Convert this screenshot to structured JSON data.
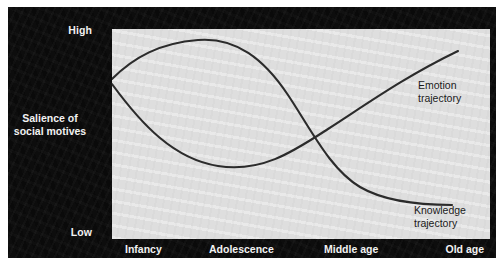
{
  "figure": {
    "panel_color": "#0d0d0d",
    "plot_color": "#dedede",
    "curve_color": "#2b2b2b",
    "text_light": "#f2f2f2",
    "text_dark": "#1a1a1a"
  },
  "axes": {
    "y_label_line1": "Salience of",
    "y_label_line2": "social motives",
    "y_high": "High",
    "y_low": "Low",
    "x_ticks": [
      {
        "label": "Infancy",
        "pos_pct": 8
      },
      {
        "label": "Adolescence",
        "pos_pct": 33
      },
      {
        "label": "Middle age",
        "pos_pct": 61
      },
      {
        "label": "Old age",
        "pos_pct": 90
      }
    ]
  },
  "annotations": {
    "emotion_line1": "Emotion",
    "emotion_line2": "trajectory",
    "knowledge_line1": "Knowledge",
    "knowledge_line2": "trajectory"
  },
  "chart_data": {
    "type": "line",
    "xlabel": "",
    "ylabel": "Salience of social motives",
    "grid": false,
    "legend": "inline-annotations",
    "x_tick_labels": [
      "Infancy",
      "Adolescence",
      "Middle age",
      "Old age"
    ],
    "y_tick_labels": [
      "Low",
      "High"
    ],
    "ylim": [
      0,
      1
    ],
    "xlim": [
      0,
      1
    ],
    "series": [
      {
        "name": "Knowledge trajectory",
        "color": "#2b2b2b",
        "comment": "Rises steeply from infancy, peaks in adolescence/early adulthood, then declines through middle age and flattens low in old age.",
        "x": [
          0.0,
          0.08,
          0.18,
          0.31,
          0.45,
          0.57,
          0.66,
          0.76,
          0.86,
          0.92
        ],
        "y": [
          0.76,
          0.84,
          0.92,
          0.9,
          0.76,
          0.52,
          0.33,
          0.19,
          0.145,
          0.14
        ]
      },
      {
        "name": "Emotion trajectory",
        "color": "#2b2b2b",
        "comment": "Starts moderately high in infancy, dips to a trough in adolescence, then rises steadily through middle age to a high point in old age.",
        "x": [
          0.0,
          0.09,
          0.2,
          0.31,
          0.43,
          0.55,
          0.66,
          0.78,
          0.89,
          0.92
        ],
        "y": [
          0.74,
          0.53,
          0.33,
          0.265,
          0.33,
          0.47,
          0.6,
          0.74,
          0.85,
          0.875
        ]
      }
    ],
    "crossings": [
      {
        "x_approx": 0.04,
        "y_approx": 0.65,
        "stage": "Infancy"
      },
      {
        "x_approx": 0.575,
        "y_approx": 0.455,
        "stage": "Middle age"
      }
    ]
  }
}
